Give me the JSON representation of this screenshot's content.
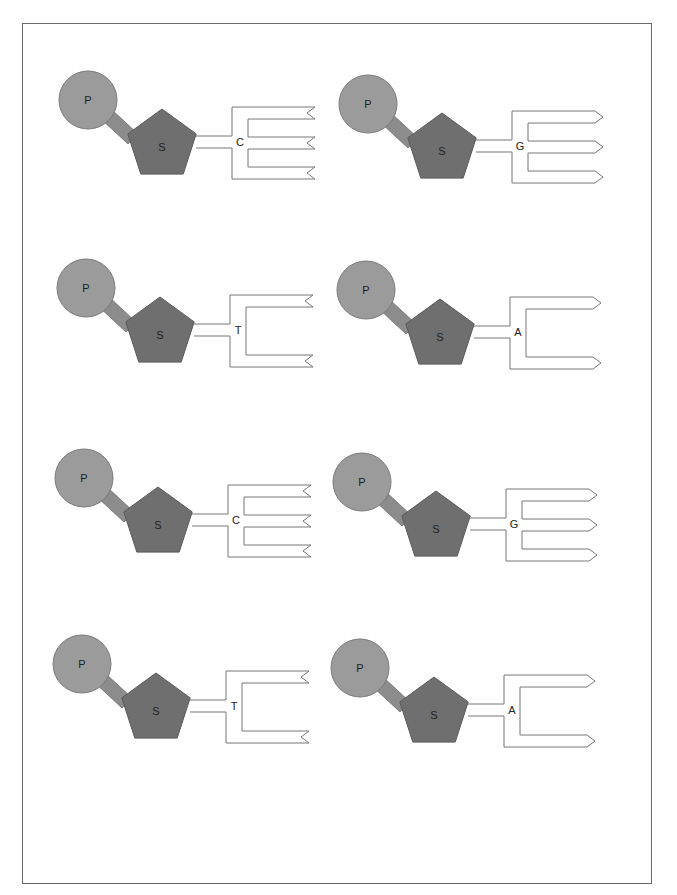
{
  "diagram": {
    "title": "",
    "colors": {
      "phosphate_fill": "#9b9b9b",
      "phosphate_stroke": "#7a7a7a",
      "sugar_fill": "#6f6f6f",
      "sugar_stroke": "#5a5a5a",
      "connector_fill": "#8c8c8c",
      "base_stroke": "#777777",
      "frame_stroke": "#6a6a6a"
    },
    "phosphate_label": "P",
    "sugar_label": "S",
    "nucleotides": [
      {
        "id": "n1",
        "base": "C",
        "prongs": 3,
        "tip": "notch",
        "x": 0,
        "y": 0
      },
      {
        "id": "n2",
        "base": "G",
        "prongs": 3,
        "tip": "arrow",
        "x": 280,
        "y": 4
      },
      {
        "id": "n3",
        "base": "T",
        "prongs": 2,
        "tip": "notch",
        "x": -2,
        "y": 188
      },
      {
        "id": "n4",
        "base": "A",
        "prongs": 2,
        "tip": "arrow",
        "x": 278,
        "y": 190
      },
      {
        "id": "n5",
        "base": "C",
        "prongs": 3,
        "tip": "notch",
        "x": -4,
        "y": 378
      },
      {
        "id": "n6",
        "base": "G",
        "prongs": 3,
        "tip": "arrow",
        "x": 274,
        "y": 382
      },
      {
        "id": "n7",
        "base": "T",
        "prongs": 2,
        "tip": "notch",
        "x": -6,
        "y": 564
      },
      {
        "id": "n8",
        "base": "A",
        "prongs": 2,
        "tip": "arrow",
        "x": 272,
        "y": 568
      }
    ]
  }
}
